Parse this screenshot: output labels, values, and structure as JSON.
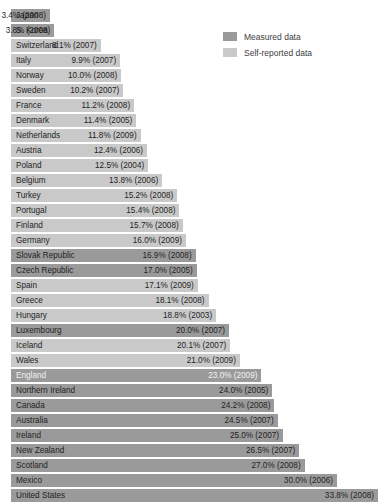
{
  "legend": {
    "position": "top-right",
    "items": [
      {
        "label": "Measured data",
        "color": "#9a9a9a",
        "key": "measured"
      },
      {
        "label": "Self-reported data",
        "color": "#c9c9c9",
        "key": "selfreported"
      }
    ]
  },
  "chart_data": {
    "type": "bar",
    "orientation": "horizontal",
    "title": "",
    "subtitle": "",
    "xlabel": "",
    "ylabel": "",
    "grid": false,
    "xlim": [
      0,
      35
    ],
    "legend_position": "top-right",
    "series": [
      {
        "name": "Measured data",
        "color": "#9a9a9a"
      },
      {
        "name": "Self-reported data",
        "color": "#c9c9c9"
      }
    ],
    "categories": [
      "Japan",
      "S. Korea",
      "Switzerland",
      "Italy",
      "Norway",
      "Sweden",
      "France",
      "Denmark",
      "Netherlands",
      "Austria",
      "Poland",
      "Belgium",
      "Turkey",
      "Portugal",
      "Finland",
      "Germany",
      "Slovak Republic",
      "Czech Republic",
      "Spain",
      "Greece",
      "Hungary",
      "Luxembourg",
      "Iceland",
      "Wales",
      "England",
      "Northern Ireland",
      "Canada",
      "Australia",
      "Ireland",
      "New Zealand",
      "Scotland",
      "Mexico",
      "United States"
    ],
    "values": [
      3.4,
      3.8,
      8.1,
      9.9,
      10.0,
      10.2,
      11.2,
      11.4,
      11.8,
      12.4,
      12.5,
      13.8,
      15.2,
      15.4,
      15.7,
      16.0,
      16.9,
      17.0,
      17.1,
      18.1,
      18.8,
      20.0,
      20.1,
      21.0,
      23.0,
      24.0,
      24.2,
      24.5,
      25.0,
      26.5,
      27.0,
      30.0,
      33.8
    ],
    "years": [
      2008,
      2008,
      2007,
      2007,
      2008,
      2007,
      2008,
      2005,
      2009,
      2006,
      2004,
      2006,
      2008,
      2008,
      2008,
      2009,
      2008,
      2005,
      2009,
      2008,
      2003,
      2007,
      2007,
      2009,
      2009,
      2005,
      2008,
      2007,
      2007,
      2007,
      2008,
      2006,
      2008
    ],
    "data_types": [
      "measured",
      "measured",
      "selfreported",
      "selfreported",
      "selfreported",
      "selfreported",
      "selfreported",
      "selfreported",
      "selfreported",
      "selfreported",
      "selfreported",
      "selfreported",
      "selfreported",
      "selfreported",
      "selfreported",
      "selfreported",
      "measured",
      "measured",
      "selfreported",
      "selfreported",
      "selfreported",
      "measured",
      "selfreported",
      "selfreported",
      "measured",
      "measured",
      "measured",
      "measured",
      "measured",
      "measured",
      "measured",
      "measured",
      "measured"
    ]
  },
  "rows": [
    {
      "country": "Japan",
      "value_label": "3.4% (2008)",
      "value": 3.4,
      "type": "measured"
    },
    {
      "country": "S. Korea",
      "value_label": "3.8% (2008)",
      "value": 3.8,
      "type": "measured"
    },
    {
      "country": "Switzerland",
      "value_label": "8.1% (2007)",
      "value": 8.1,
      "type": "selfreported"
    },
    {
      "country": "Italy",
      "value_label": "9.9% (2007)",
      "value": 9.9,
      "type": "selfreported"
    },
    {
      "country": "Norway",
      "value_label": "10.0% (2008)",
      "value": 10.0,
      "type": "selfreported"
    },
    {
      "country": "Sweden",
      "value_label": "10.2% (2007)",
      "value": 10.2,
      "type": "selfreported"
    },
    {
      "country": "France",
      "value_label": "11.2% (2008)",
      "value": 11.2,
      "type": "selfreported"
    },
    {
      "country": "Denmark",
      "value_label": "11.4% (2005)",
      "value": 11.4,
      "type": "selfreported"
    },
    {
      "country": "Netherlands",
      "value_label": "11.8% (2009)",
      "value": 11.8,
      "type": "selfreported"
    },
    {
      "country": "Austria",
      "value_label": "12.4% (2006)",
      "value": 12.4,
      "type": "selfreported"
    },
    {
      "country": "Poland",
      "value_label": "12.5% (2004)",
      "value": 12.5,
      "type": "selfreported"
    },
    {
      "country": "Belgium",
      "value_label": "13.8% (2006)",
      "value": 13.8,
      "type": "selfreported"
    },
    {
      "country": "Turkey",
      "value_label": "15.2% (2008)",
      "value": 15.2,
      "type": "selfreported"
    },
    {
      "country": "Portugal",
      "value_label": "15.4% (2008)",
      "value": 15.4,
      "type": "selfreported"
    },
    {
      "country": "Finland",
      "value_label": "15.7% (2008)",
      "value": 15.7,
      "type": "selfreported"
    },
    {
      "country": "Germany",
      "value_label": "16.0% (2009)",
      "value": 16.0,
      "type": "selfreported"
    },
    {
      "country": "Slovak Republic",
      "value_label": "16.9% (2008)",
      "value": 16.9,
      "type": "measured"
    },
    {
      "country": "Czech Republic",
      "value_label": "17.0% (2005)",
      "value": 17.0,
      "type": "measured"
    },
    {
      "country": "Spain",
      "value_label": "17.1% (2009)",
      "value": 17.1,
      "type": "selfreported"
    },
    {
      "country": "Greece",
      "value_label": "18.1% (2008)",
      "value": 18.1,
      "type": "selfreported"
    },
    {
      "country": "Hungary",
      "value_label": "18.8% (2003)",
      "value": 18.8,
      "type": "selfreported"
    },
    {
      "country": "Luxembourg",
      "value_label": "20.0% (2007)",
      "value": 20.0,
      "type": "measured"
    },
    {
      "country": "Iceland",
      "value_label": "20.1% (2007)",
      "value": 20.1,
      "type": "selfreported"
    },
    {
      "country": "Wales",
      "value_label": "21.0% (2009)",
      "value": 21.0,
      "type": "selfreported"
    },
    {
      "country": "England",
      "value_label": "23.0% (2009)",
      "value": 23.0,
      "type": "measured"
    },
    {
      "country": "Northern Ireland",
      "value_label": "24.0% (2005)",
      "value": 24.0,
      "type": "measured"
    },
    {
      "country": "Canada",
      "value_label": "24.2% (2008)",
      "value": 24.2,
      "type": "measured"
    },
    {
      "country": "Australia",
      "value_label": "24.5% (2007)",
      "value": 24.5,
      "type": "measured"
    },
    {
      "country": "Ireland",
      "value_label": "25.0% (2007)",
      "value": 25.0,
      "type": "measured"
    },
    {
      "country": "New Zealand",
      "value_label": "26.5% (2007)",
      "value": 26.5,
      "type": "measured"
    },
    {
      "country": "Scotland",
      "value_label": "27.0% (2008)",
      "value": 27.0,
      "type": "measured"
    },
    {
      "country": "Mexico",
      "value_label": "30.0% (2006)",
      "value": 30.0,
      "type": "measured"
    },
    {
      "country": "United States",
      "value_label": "33.8% (2008)",
      "value": 33.8,
      "type": "measured"
    }
  ]
}
